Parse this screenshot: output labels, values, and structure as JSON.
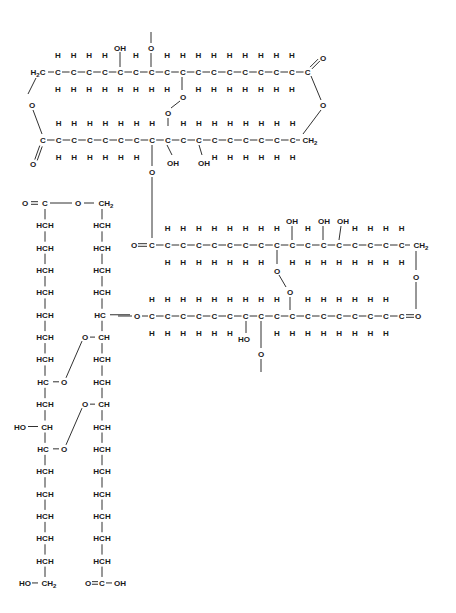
{
  "figure": {
    "colors": {
      "ink": "#1a1a1a",
      "background": "#ffffff"
    },
    "labels": {
      "H": "H",
      "C": "C",
      "O": "O",
      "OH": "OH",
      "HO": "HO",
      "H2": "H",
      "two": "2",
      "HCH": "HCH",
      "HC": "HC",
      "CH": "CH",
      "CH2": "CH",
      "O_C": "O",
      "OH_acid": "OH"
    },
    "chains": [
      {
        "id": "chain-1-top",
        "start": "H2C",
        "carbons": 17,
        "end": "C(=O)-O",
        "substituents": [
          {
            "position": 5,
            "up": "OH"
          },
          {
            "position": 7,
            "up": "O-"
          },
          {
            "position": 9,
            "down": "O-O"
          }
        ]
      },
      {
        "id": "chain-2",
        "start": "O=C",
        "carbons": 17,
        "end": "CH2",
        "substituents": [
          {
            "position": 8,
            "down": "O"
          },
          {
            "position": 9,
            "up": "O"
          },
          {
            "position": 10,
            "down": "OH"
          },
          {
            "position": 11,
            "down": "OH"
          }
        ]
      },
      {
        "id": "chain-3",
        "start": "O=C",
        "carbons": 17,
        "end": "CH2",
        "substituents": [
          {
            "position": 9,
            "down": "O-O"
          },
          {
            "position": 10,
            "up": "OH"
          },
          {
            "position": 12,
            "up": "OH"
          },
          {
            "position": 13,
            "up": "OH"
          }
        ]
      },
      {
        "id": "chain-4",
        "start": "HC-O",
        "carbons": 17,
        "end": "C=O",
        "substituents": [
          {
            "position": 7,
            "down": "HO"
          },
          {
            "position": 8,
            "down": "O-"
          },
          {
            "position": 10,
            "up": "O"
          }
        ]
      }
    ],
    "columns": [
      {
        "id": "left-column",
        "top": "O=C",
        "rows": [
          "HCH",
          "HCH",
          "HCH",
          "HCH",
          "HCH",
          "HCH",
          "HCH",
          "HC-O",
          "HCH",
          "HO-CH",
          "HC-O",
          "HCH",
          "HCH",
          "HCH",
          "HCH",
          "HCH"
        ],
        "bottom": "HO-CH2"
      },
      {
        "id": "right-column",
        "top": "O-CH2",
        "rows": [
          "HCH",
          "HCH",
          "HCH",
          "HCH",
          "HC-O",
          "O-CH",
          "HCH",
          "HCH",
          "O-CH",
          "HCH",
          "HCH",
          "HCH",
          "HCH",
          "HCH",
          "HCH",
          "HCH"
        ],
        "bottom": "O=C-OH"
      }
    ]
  }
}
